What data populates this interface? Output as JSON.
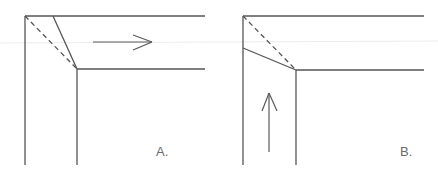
{
  "diagram": {
    "panels": [
      {
        "id": "A",
        "label": "A.",
        "arrow_direction": "right",
        "description": "Corner miter with solid cut line from top edge to inner corner; dashed diagonal from outer to inner corner"
      },
      {
        "id": "B",
        "label": "B.",
        "arrow_direction": "up",
        "description": "Corner miter with solid cut line from left edge to inner corner; dashed diagonal from outer to inner corner"
      }
    ],
    "colors": {
      "line": "#555555",
      "background": "#ffffff"
    }
  }
}
